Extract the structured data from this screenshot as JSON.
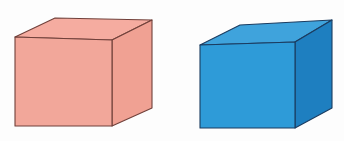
{
  "canvas": {
    "width": 344,
    "height": 141,
    "background_color": "#fdfdfd",
    "title": "Two cubes illustration"
  },
  "figure": {
    "type": "illustration",
    "object_count": 2
  },
  "objects": [
    {
      "name": "pink-cube",
      "label": "Pink cube",
      "position": "left",
      "fill_front": "#f2a79a",
      "fill_top": "#f5aca0",
      "fill_side": "#f0a193",
      "stroke": "#70403a",
      "stroke_width": 1.1,
      "geometry": {
        "front": "15,37 112,40 112,126 15,126",
        "top": "15,37 55,18 152,20 112,40",
        "side": "112,40 152,20 152,108 112,126"
      }
    },
    {
      "name": "blue-cube",
      "label": "Blue cube",
      "position": "right",
      "fill_front": "#2e9bd8",
      "fill_top": "#3fa3dc",
      "fill_side": "#1e7fc0",
      "stroke": "#1b3c60",
      "stroke_width": 1.1,
      "geometry": {
        "front": "200,45 295,42 295,128 200,128",
        "top": "200,45 240,25 332,20 295,42",
        "side": "295,42 332,20 332,108 295,128"
      }
    }
  ]
}
